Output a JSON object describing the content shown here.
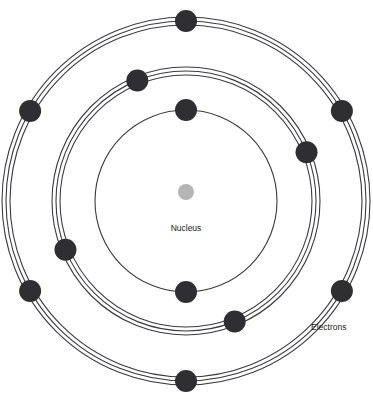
{
  "diagram": {
    "background_color": "#ffffff",
    "center": {
      "x": 186,
      "y": 201
    }
  },
  "nucleus": {
    "label": "Nucleus",
    "color": "#b5b5b5",
    "radius": 8,
    "cx": 186,
    "cy": 192,
    "label_x": 186,
    "label_y": 231
  },
  "electron_legend": {
    "label": "Electrons",
    "x": 311,
    "y": 330
  },
  "style": {
    "ring_color": "#3a3a40",
    "ring_stroke_width": 1.1,
    "electron_color": "#2e2e33",
    "electron_radius": 11,
    "text_color": "#1c1c20"
  },
  "chart_data": {
    "type": "diagram",
    "subtype": "bohr-atomic-model",
    "center": {
      "x": 186,
      "y": 201
    },
    "nucleus": {
      "label": "Nucleus",
      "radius": 8,
      "color": "#b5b5b5"
    },
    "shells": [
      {
        "name": "inner-shell",
        "order": 1,
        "radius": 91,
        "line_count": 1,
        "line_offsets": [
          0
        ],
        "electron_count": 2,
        "electron_angles_deg": [
          270,
          90
        ]
      },
      {
        "name": "middle-shell",
        "order": 2,
        "radius": 130,
        "line_count": 3,
        "line_offsets": [
          -4,
          0,
          4
        ],
        "electron_count": 4,
        "electron_angles_deg": [
          292,
          202,
          112,
          22
        ]
      },
      {
        "name": "outer-shell",
        "order": 3,
        "radius": 180,
        "line_count": 3,
        "line_offsets": [
          -4,
          0,
          4
        ],
        "electron_count": 6,
        "electron_angles_deg": [
          270,
          330,
          30,
          90,
          150,
          210
        ]
      }
    ],
    "total_electrons": 12,
    "annotations": [
      {
        "text": "Nucleus",
        "x": 186,
        "y": 231,
        "anchor": "middle"
      },
      {
        "text": "Electrons",
        "x": 311,
        "y": 330,
        "anchor": "start"
      }
    ]
  }
}
